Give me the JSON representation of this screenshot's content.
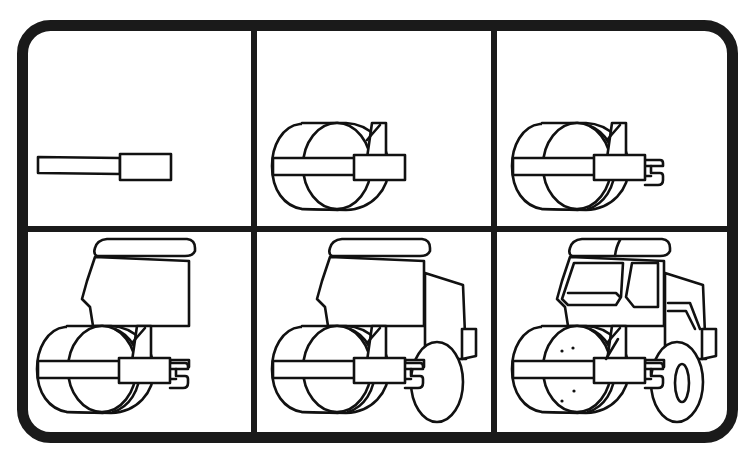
{
  "title": "How to draw a road roller — 6 steps",
  "colors": {
    "ink": "#111111",
    "paper": "#ffffff",
    "frame": "#1a1a1a"
  },
  "grid": {
    "rows": 2,
    "cols": 3
  },
  "panels": [
    {
      "step": 1,
      "label": "Step 1",
      "content": "roller frame bar and bracket block"
    },
    {
      "step": 2,
      "label": "Step 2",
      "content": "roller drum added behind the bar"
    },
    {
      "step": 3,
      "label": "Step 3",
      "content": "drum inner rim and rear hitch"
    },
    {
      "step": 4,
      "label": "Step 4",
      "content": "cab body with roof"
    },
    {
      "step": 5,
      "label": "Step 5",
      "content": "engine housing and rear wheel"
    },
    {
      "step": 6,
      "label": "Step 6",
      "content": "windows, bolts, wheel hub and details"
    }
  ]
}
